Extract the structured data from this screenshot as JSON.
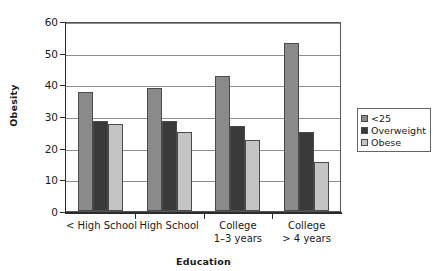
{
  "chart_data": {
    "type": "bar",
    "title": "",
    "xlabel": "Education",
    "ylabel": "Obesity",
    "ylim": [
      0,
      60
    ],
    "yticks": [
      0,
      10,
      20,
      30,
      40,
      50,
      60
    ],
    "grid": true,
    "legend_position": "right",
    "categories": [
      "< High School",
      "High School",
      "College 1–3 years",
      "College > 4 years"
    ],
    "category_lines": [
      [
        "< High School"
      ],
      [
        "High School"
      ],
      [
        "College",
        "1–3 years"
      ],
      [
        "College",
        "> 4 years"
      ]
    ],
    "series": [
      {
        "name": "<25",
        "color": "#8a8a8a",
        "values": [
          37.5,
          39.0,
          42.5,
          53.0
        ]
      },
      {
        "name": "Overweight",
        "color": "#3a3a3a",
        "values": [
          28.5,
          28.5,
          27.0,
          25.0
        ]
      },
      {
        "name": "Obese",
        "color": "#c4c4c4",
        "values": [
          27.5,
          25.0,
          22.5,
          15.5
        ]
      }
    ]
  },
  "legend": {
    "items": [
      {
        "label": "<25"
      },
      {
        "label": "Overweight"
      },
      {
        "label": "Obese"
      }
    ]
  },
  "axes": {
    "y_title": "Obesity",
    "x_title": "Education"
  }
}
